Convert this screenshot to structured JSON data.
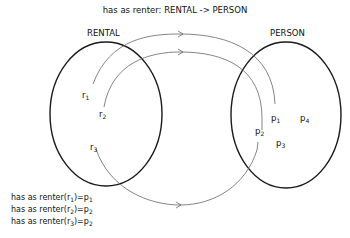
{
  "title": "has as renter: RENTAL -> PERSON",
  "sets": {
    "domain": {
      "label": "RENTAL",
      "elements": [
        {
          "base": "r",
          "sub": "1"
        },
        {
          "base": "r",
          "sub": "2"
        },
        {
          "base": "r",
          "sub": "3"
        }
      ]
    },
    "codomain": {
      "label": "PERSON",
      "elements": [
        {
          "base": "p",
          "sub": "1"
        },
        {
          "base": "p",
          "sub": "2"
        },
        {
          "base": "p",
          "sub": "3"
        },
        {
          "base": "p",
          "sub": "4"
        }
      ]
    }
  },
  "mappings": [
    {
      "from": "r1",
      "to": "p1"
    },
    {
      "from": "r2",
      "to": "p2"
    },
    {
      "from": "r3",
      "to": "p2"
    }
  ],
  "function_lines": [
    {
      "prefix": "has as renter(",
      "arg_base": "r",
      "arg_sub": "1",
      "mid": ")=",
      "val_base": "p",
      "val_sub": "1"
    },
    {
      "prefix": "has as renter(",
      "arg_base": "r",
      "arg_sub": "2",
      "mid": ")=",
      "val_base": "p",
      "val_sub": "2"
    },
    {
      "prefix": "has as renter(",
      "arg_base": "r",
      "arg_sub": "3",
      "mid": ")=",
      "val_base": "p",
      "val_sub": "2"
    }
  ],
  "colors": {
    "ellipse": "#1a1a1a",
    "arrow": "#555555",
    "text": "#111111"
  }
}
